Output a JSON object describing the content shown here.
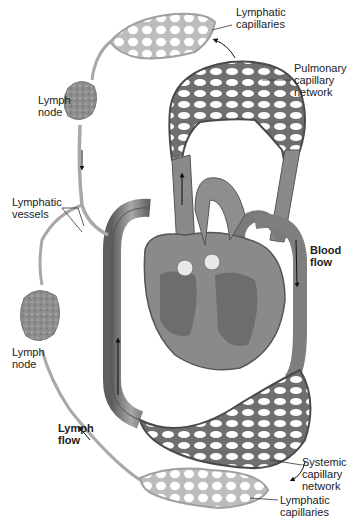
{
  "diagram": {
    "colors": {
      "blood_vessel": "#8a8a8a",
      "blood_vessel_dark": "#555555",
      "lymphatic": "#b8b8b8",
      "lymph_node": "#8c8c8c",
      "heart": "#7a7a7a",
      "label_text": "#222222",
      "leader_line": "#333333"
    },
    "labels": {
      "lymphatic_capillaries_top": "Lymphatic\ncapillaries",
      "pulmonary_capillary_network": "Pulmonary\ncapillary\nnetwork",
      "lymph_node_top": "Lymph\nnode",
      "lymphatic_vessels": "Lymphatic\nvessels",
      "blood_flow": "Blood\nflow",
      "lymph_node_bottom": "Lymph\nnode",
      "lymph_flow": "Lymph\nflow",
      "systemic_capillary_network": "Systemic\ncapillary\nnetwork",
      "lymphatic_capillaries_bottom": "Lymphatic\ncapillaries"
    },
    "structures": [
      "pulmonary-capillary-network",
      "systemic-capillary-network",
      "heart",
      "lymphatic-capillaries-top",
      "lymphatic-capillaries-bottom",
      "lymph-node-top",
      "lymph-node-bottom",
      "lymphatic-vessels",
      "aorta",
      "vena-cava",
      "pulmonary-vessels"
    ]
  }
}
